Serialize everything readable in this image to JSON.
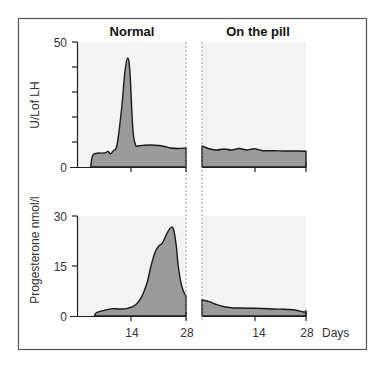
{
  "chart_data": [
    {
      "type": "area",
      "panel": "top",
      "ylabel": "U/Lof LH",
      "ylim": [
        0,
        50
      ],
      "yticks": [
        0,
        10,
        20,
        30,
        40,
        50
      ],
      "ytick_labels": [
        "0",
        "",
        "",
        "",
        "",
        "50"
      ],
      "xlim": [
        0,
        28
      ],
      "xticks": [
        14,
        28
      ],
      "series": [
        {
          "name": "Normal",
          "x": [
            3.5,
            4,
            5,
            7,
            8,
            8.6,
            9.3,
            10.3,
            11.5,
            12.3,
            13.0,
            13.6,
            14.3,
            15.0,
            15.8,
            17,
            19,
            21,
            22.5,
            24,
            26,
            28
          ],
          "values": [
            0,
            4.5,
            5.5,
            5.6,
            6.2,
            5.3,
            6.5,
            9,
            24,
            38,
            43.6,
            38,
            16,
            9,
            8.5,
            8.7,
            8.8,
            8.6,
            8.2,
            7.6,
            7.4,
            7.6
          ]
        },
        {
          "name": "On the pill",
          "x": [
            0,
            2,
            4,
            6,
            8,
            10,
            12,
            14,
            16,
            18,
            20,
            22,
            24,
            26,
            28
          ],
          "values": [
            8.4,
            7.3,
            6.8,
            7.2,
            6.8,
            7.4,
            6.8,
            7.3,
            6.6,
            6.5,
            6.5,
            6.4,
            6.4,
            6.4,
            6.3
          ]
        }
      ]
    },
    {
      "type": "area",
      "panel": "bottom",
      "ylabel": "Progesterone nmol/l",
      "ylim": [
        0,
        30
      ],
      "yticks": [
        0,
        15,
        30
      ],
      "ytick_labels": [
        "0",
        "15",
        "30"
      ],
      "xlim": [
        0,
        28
      ],
      "xticks": [
        14,
        28
      ],
      "xtick_labels": [
        "14",
        "28"
      ],
      "xlabel": "Days",
      "series": [
        {
          "name": "Normal",
          "x": [
            4.5,
            5,
            7,
            9,
            11,
            13,
            15,
            16.5,
            18,
            19,
            20,
            21,
            22,
            23,
            24,
            24.8,
            25.5,
            26,
            26.7,
            27.3,
            28
          ],
          "values": [
            0,
            1,
            1.7,
            2.2,
            2.1,
            2.3,
            3.3,
            5.5,
            10,
            15,
            19,
            21,
            22,
            24.5,
            26.4,
            26,
            21,
            15,
            10,
            7.5,
            6
          ]
        },
        {
          "name": "On the pill",
          "x": [
            0,
            2,
            4,
            6,
            8,
            10,
            14,
            18,
            22,
            25,
            27,
            28
          ],
          "values": [
            4.8,
            4.3,
            3.4,
            2.8,
            2.5,
            2.4,
            2.3,
            2.2,
            2.0,
            1.8,
            1.3,
            1.2
          ]
        }
      ]
    }
  ],
  "titles": {
    "normal": "Normal",
    "pill": "On the pill"
  },
  "axes": {
    "lh_ylabel": "U/Lof LH",
    "lh_ytick_top": "50",
    "lh_ytick_zero": "0",
    "prog_ylabel": "Progesterone nmol/l",
    "prog_ytick_top": "30",
    "prog_ytick_mid": "15",
    "prog_ytick_zero": "0",
    "x_tick_14": "14",
    "x_tick_28": "28",
    "x_unit": "Days"
  },
  "colors": {
    "fill": "#9b9b9b",
    "line": "#1a1a1a",
    "panel_bg": "#f3f3f3"
  }
}
